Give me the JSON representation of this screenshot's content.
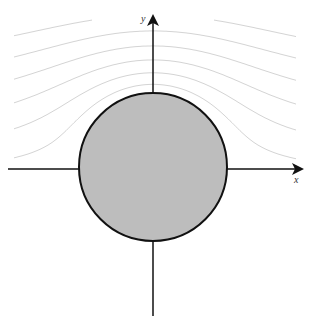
{
  "figure": {
    "width": 313,
    "height": 327,
    "background": "#ffffff"
  },
  "cylinder": {
    "cx": 153,
    "cy": 167,
    "r": 74,
    "fill": "#bdbdbd",
    "stroke": "#111111",
    "stroke_width": 2
  },
  "axes": {
    "color": "#111111",
    "x_axis": {
      "label": "x",
      "x1": 8,
      "x2": 302,
      "y": 169
    },
    "y_axis": {
      "label": "y",
      "x": 153,
      "y1": 316,
      "y2": 16
    }
  },
  "streamlines": {
    "color": "#d4d4d4",
    "stroke_width": 1,
    "description": "Potential flow around a cylinder with circulation (lifting flow); lines crowd above the cylinder and spread out below",
    "region": {
      "x1": 14,
      "x2": 296,
      "y1": 20,
      "y2": 310
    },
    "uniform_speed": 1.0,
    "circulation": 1.6,
    "levels_above": [
      0.25,
      0.55,
      0.85,
      1.15,
      1.45,
      1.75,
      2.05,
      2.35,
      2.65,
      2.95,
      3.25,
      3.55,
      3.85,
      4.15,
      4.45,
      4.75
    ],
    "levels_below": [
      0.9,
      1.25,
      1.55,
      1.85,
      2.15,
      2.45,
      2.75
    ]
  }
}
